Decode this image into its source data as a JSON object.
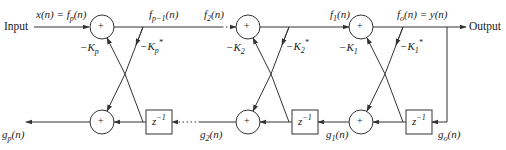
{
  "diagram": {
    "type": "lattice filter signal flow graph",
    "input_label": "Input",
    "output_label": "Output",
    "top_signals": {
      "input": "x(n) = f_p(n)",
      "after_stage_p": "f_{p-1}(n)",
      "before_stage_2": "f_2(n)",
      "after_stage_2": "f_1(n)",
      "output": "f_o(n) = y(n)"
    },
    "bottom_signals": {
      "output_g": "g_p(n)",
      "g2": "g_2(n)",
      "g1": "g_1(n)",
      "g0": "g_o(n)"
    },
    "stages": [
      {
        "name": "stage-p",
        "coef_lower": "−K_p",
        "coef_upper": "−K_p*",
        "delay": "z^-1",
        "sum": "+"
      },
      {
        "name": "stage-2",
        "coef_lower": "−K_2",
        "coef_upper": "−K_2*",
        "delay": "z^-1",
        "sum": "+"
      },
      {
        "name": "stage-1",
        "coef_lower": "−K_1",
        "coef_upper": "−K_1*",
        "delay": "z^-1",
        "sum": "+"
      }
    ],
    "ellipsis": "···",
    "colors": {
      "line": "#333333",
      "text": "#222222",
      "background": "#ffffff"
    }
  }
}
